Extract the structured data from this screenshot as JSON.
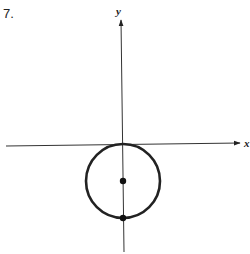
{
  "problem": {
    "number": "7."
  },
  "axes": {
    "x_label": "x",
    "y_label": "y",
    "origin_px": [
      122,
      145
    ],
    "x_axis": {
      "from": [
        6,
        146
      ],
      "to": [
        242,
        143
      ]
    },
    "y_axis": {
      "from": [
        124,
        252
      ],
      "to": [
        121,
        20
      ]
    }
  },
  "circle": {
    "center_px": [
      123,
      181
    ],
    "radius_px": 37,
    "tangent_to": "x-axis at origin",
    "stroke_color": "#222222"
  },
  "points": [
    {
      "name": "center",
      "px": [
        123,
        181
      ]
    },
    {
      "name": "bottom",
      "px": [
        123,
        218
      ]
    }
  ]
}
